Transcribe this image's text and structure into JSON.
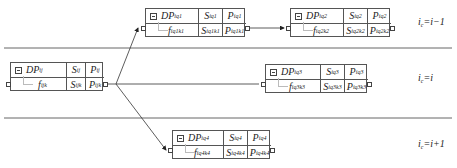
{
  "lanes": [
    {
      "label_main": "i",
      "label_sub": "c",
      "label_rest": "=i−1"
    },
    {
      "label_main": "i",
      "label_sub": "c",
      "label_rest": "=i"
    },
    {
      "label_main": "i",
      "label_sub": "c",
      "label_rest": "=i+1"
    }
  ],
  "nodes": {
    "ij": {
      "dp": "DP",
      "dp_sub": "ij",
      "s": "S",
      "s_sub": "ij",
      "p": "P",
      "p_sub": "ij",
      "f": "f",
      "f_sub": "ijk",
      "s2": "S",
      "s2_sub": "ijk",
      "p2": "P",
      "p2_sub": "ijk"
    },
    "iq1": {
      "dp": "DP",
      "dp_sub": "iq1",
      "s": "S",
      "s_sub": "iq1",
      "p": "P",
      "p_sub": "iq1",
      "f": "f",
      "f_sub": "iq1k1",
      "s2": "S",
      "s2_sub": "iq1k1",
      "p2": "P",
      "p2_sub": "iq1k1"
    },
    "iq2": {
      "dp": "DP",
      "dp_sub": "iq2",
      "s": "S",
      "s_sub": "iq2",
      "p": "P",
      "p_sub": "iq2",
      "f": "f",
      "f_sub": "iq2k2",
      "s2": "S",
      "s2_sub": "iq2k2",
      "p2": "P",
      "p2_sub": "iq2k2"
    },
    "iq3": {
      "dp": "DP",
      "dp_sub": "iq3",
      "s": "S",
      "s_sub": "iq3",
      "p": "P",
      "p_sub": "iq3",
      "f": "f",
      "f_sub": "iq3k3",
      "s2": "S",
      "s2_sub": "iq3k3",
      "p2": "P",
      "p2_sub": "iq3k3"
    },
    "iq4": {
      "dp": "DP",
      "dp_sub": "iq4",
      "s": "S",
      "s_sub": "iq4",
      "p": "P",
      "p_sub": "iq4",
      "f": "f",
      "f_sub": "iq4k4",
      "s2": "S",
      "s2_sub": "iq4k4",
      "p2": "P",
      "p2_sub": "iq4k4"
    }
  },
  "colors": {
    "line": "#444444",
    "separator": "#666666",
    "border": "#555555"
  }
}
